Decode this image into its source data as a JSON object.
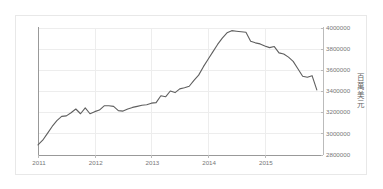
{
  "chart_data": {
    "type": "line",
    "title": "",
    "xlabel": "",
    "ylabel": "百萬美元",
    "ylabel_chars": [
      "百",
      "萬",
      "美",
      "元"
    ],
    "xlim": [
      2011.0,
      2015.92
    ],
    "ylim": [
      2800000,
      4000000
    ],
    "grid": true,
    "legend": null,
    "line_color": "#5f5f5f",
    "grid_color": "#ededed",
    "axis_color": "#999999",
    "y_ticks": [
      2800000,
      3000000,
      3200000,
      3400000,
      3600000,
      3800000,
      4000000
    ],
    "y_tick_labels": [
      "2800000",
      "3000000",
      "3200000",
      "3400000",
      "3600000",
      "3800000",
      "4000000"
    ],
    "x_ticks": [
      2011,
      2012,
      2013,
      2014,
      2015
    ],
    "x_tick_labels": [
      "2011",
      "2012",
      "2013",
      "2014",
      "2015"
    ],
    "series": [
      {
        "name": "外匯存底",
        "x": [
          2011.0,
          2011.083,
          2011.167,
          2011.25,
          2011.333,
          2011.417,
          2011.5,
          2011.583,
          2011.667,
          2011.75,
          2011.833,
          2011.917,
          2012.0,
          2012.083,
          2012.167,
          2012.25,
          2012.333,
          2012.417,
          2012.5,
          2012.583,
          2012.667,
          2012.75,
          2012.833,
          2012.917,
          2013.0,
          2013.083,
          2013.167,
          2013.25,
          2013.333,
          2013.417,
          2013.5,
          2013.583,
          2013.667,
          2013.75,
          2013.833,
          2013.917,
          2014.0,
          2014.083,
          2014.167,
          2014.25,
          2014.333,
          2014.417,
          2014.5,
          2014.583,
          2014.667,
          2014.75,
          2014.833,
          2014.917,
          2015.0,
          2015.083,
          2015.167,
          2015.25,
          2015.333,
          2015.417,
          2015.5,
          2015.583,
          2015.667,
          2015.75,
          2015.833,
          2015.917
        ],
        "values": [
          2890000,
          2935000,
          3000000,
          3065000,
          3120000,
          3160000,
          3165000,
          3195000,
          3230000,
          3185000,
          3240000,
          3185000,
          3205000,
          3220000,
          3260000,
          3260000,
          3255000,
          3215000,
          3210000,
          3230000,
          3245000,
          3255000,
          3265000,
          3270000,
          3285000,
          3290000,
          3355000,
          3345000,
          3400000,
          3385000,
          3420000,
          3430000,
          3445000,
          3500000,
          3550000,
          3630000,
          3700000,
          3770000,
          3840000,
          3900000,
          3950000,
          3970000,
          3965000,
          3960000,
          3955000,
          3870000,
          3855000,
          3845000,
          3825000,
          3810000,
          3820000,
          3760000,
          3750000,
          3720000,
          3680000,
          3610000,
          3540000,
          3530000,
          3545000,
          3410000
        ]
      }
    ]
  },
  "axis_title": {
    "text": "百萬美元"
  }
}
